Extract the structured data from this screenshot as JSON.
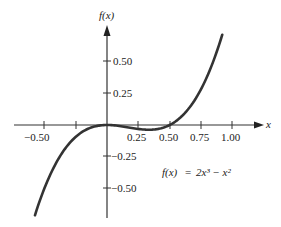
{
  "chart_data": {
    "type": "line",
    "title": "",
    "xlabel": "x",
    "ylabel": "f(x)",
    "annotation": "f(x) = 2x³ − x²",
    "function": "2x^3 - x^2",
    "xlim": [
      -0.575,
      0.92
    ],
    "ylim": [
      -0.72,
      0.72
    ],
    "x_ticks": [
      -0.75,
      -0.5,
      -0.25,
      0.25,
      0.5,
      0.75,
      1.0
    ],
    "x_tick_labels": [
      "−0.50",
      "0.25",
      "0.50",
      "0.75",
      "1.00"
    ],
    "y_ticks": [
      0.5,
      0.25,
      -0.25,
      -0.5
    ],
    "y_tick_labels": [
      "0.50",
      "0.25",
      "−0.25",
      "−0.50"
    ],
    "grid": false,
    "series": [
      {
        "name": "f(x) = 2x^3 - x^2",
        "x": [
          -0.575,
          -0.5,
          -0.25,
          0,
          0.25,
          0.333,
          0.5,
          0.75,
          0.92
        ],
        "values": [
          -0.71,
          -0.5,
          -0.094,
          0,
          -0.031,
          -0.037,
          0,
          0.281,
          0.71
        ]
      }
    ]
  },
  "labels": {
    "y_axis": "f(x)",
    "x_axis": "x",
    "x_neg050": "−0.50",
    "x_025": "0.25",
    "x_050": "0.50",
    "x_075": "0.75",
    "x_100": "1.00",
    "y_050": "0.50",
    "y_025": "0.25",
    "y_neg025": "−0.25",
    "y_neg050": "−0.50",
    "formula_lhs": "f(x)",
    "formula_eq": "=",
    "formula_rhs": "2x³ − x²"
  }
}
